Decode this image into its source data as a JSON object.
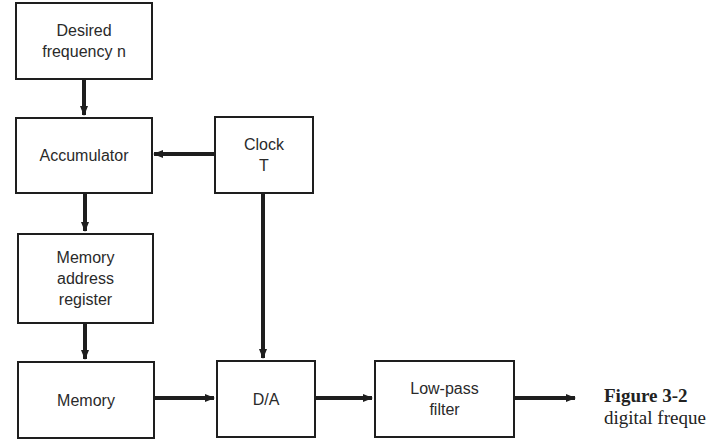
{
  "diagram": {
    "blocks": {
      "desired_frequency": "Desired\nfrequency n",
      "accumulator": "Accumulator",
      "clock": "Clock\nT",
      "memory_address_register": "Memory\naddress\nregister",
      "memory": "Memory",
      "da_converter": "D/A",
      "low_pass_filter": "Low-pass\nfilter"
    },
    "connections": [
      {
        "from": "desired_frequency",
        "to": "accumulator"
      },
      {
        "from": "clock",
        "to": "accumulator"
      },
      {
        "from": "accumulator",
        "to": "memory_address_register"
      },
      {
        "from": "memory_address_register",
        "to": "memory"
      },
      {
        "from": "clock",
        "to": "da_converter"
      },
      {
        "from": "memory",
        "to": "da_converter"
      },
      {
        "from": "da_converter",
        "to": "low_pass_filter"
      },
      {
        "from": "low_pass_filter",
        "to": "output"
      }
    ],
    "caption": {
      "label": "Figure 3-2",
      "line1_rest": "",
      "line2": "digital freque"
    }
  }
}
